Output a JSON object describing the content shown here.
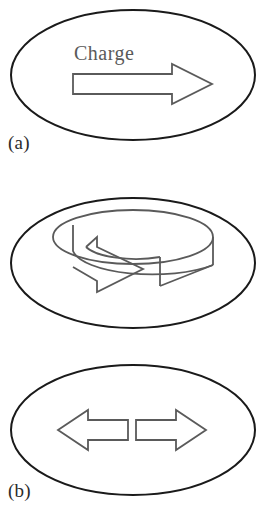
{
  "figure": {
    "title": "",
    "background_color": "#ffffff",
    "width": 263,
    "height": 524,
    "outline_color": "#1a1a1a",
    "arrow_color": "#5a5a5a",
    "text_color": "#2b2b2b"
  },
  "panels": [
    {
      "id": "a",
      "label": "(a)",
      "caption": "Charge",
      "shape": "ellipse",
      "arrow_type": "single-right-arrow",
      "arrow_name": "translation-arrow"
    },
    {
      "id": "b",
      "label": "(b)",
      "caption": "",
      "shape": "ellipse",
      "arrow_type": "circular-rotation-arrow",
      "arrow_name": "rotation-arrow"
    },
    {
      "id": "c",
      "label": "(c)",
      "caption": "",
      "shape": "ellipse",
      "arrow_type": "double-opposed-arrows",
      "arrow_name": "expansion-arrows"
    }
  ],
  "labels": {
    "a": "(a)",
    "b": "(b)",
    "c": "(c)"
  },
  "captions": {
    "charge": "Charge"
  }
}
